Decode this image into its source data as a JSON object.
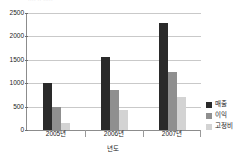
{
  "top_strip": {
    "ghost_text": "····   ··   ·····"
  },
  "chart_data": {
    "type": "bar",
    "title": "",
    "subtitle": "",
    "xlabel": "년도",
    "ylabel": "",
    "ylim": [
      0,
      2500
    ],
    "yticks": [
      0,
      500,
      1000,
      1500,
      2000,
      2500
    ],
    "ytick_labels": [
      "0",
      "500",
      "1000",
      "1500",
      "2000",
      "2500"
    ],
    "grid": true,
    "legend_position": "right",
    "categories": [
      "2005년",
      "2006년",
      "2007년"
    ],
    "series": [
      {
        "name": "매출",
        "color": "#2a2a2a",
        "values": [
          1000,
          1560,
          2290
        ]
      },
      {
        "name": "이익",
        "color": "#8f8f8f",
        "values": [
          490,
          860,
          1250
        ]
      },
      {
        "name": "고정비",
        "color": "#d3d3d3",
        "values": [
          150,
          430,
          710
        ]
      }
    ]
  }
}
